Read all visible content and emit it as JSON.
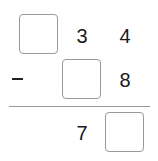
{
  "problem": {
    "operation": "subtraction",
    "operator_symbol": "−",
    "row1": {
      "tens": "",
      "ones_left": "3",
      "ones": "4"
    },
    "row2": {
      "tens": "8"
    },
    "result": {
      "tens": "7",
      "ones": ""
    },
    "blanks": [
      {
        "row": 1,
        "position": "hundreds",
        "value": ""
      },
      {
        "row": 2,
        "position": "tens",
        "value": ""
      },
      {
        "row": 3,
        "position": "ones",
        "value": ""
      }
    ],
    "digits": {
      "r1_tens": "3",
      "r1_ones": "4",
      "r2_ones": "8",
      "res_tens": "7"
    }
  }
}
